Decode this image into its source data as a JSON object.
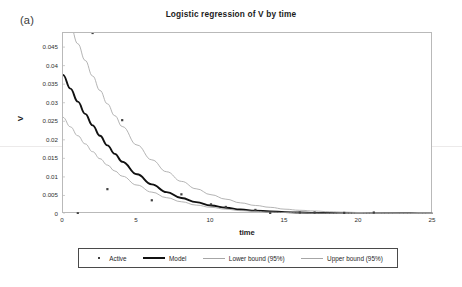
{
  "panel": {
    "label": "(a)"
  },
  "chart_data": {
    "type": "scatter",
    "title": "Logistic regression of V by time",
    "xlabel": "time",
    "ylabel": "V",
    "xlim": [
      0,
      25
    ],
    "ylim": [
      0,
      0.0488
    ],
    "grid": false,
    "legend_position": "bottom",
    "xticks": [
      "0",
      "5",
      "10",
      "15",
      "20",
      "25"
    ],
    "xtick_values": [
      0,
      5,
      10,
      15,
      20,
      25
    ],
    "yticks": [
      "0",
      "0.005",
      "0.01",
      "0.015",
      "0.02",
      "0.025",
      "0.03",
      "0.035",
      "0.04",
      "0.045"
    ],
    "ytick_values": [
      0,
      0.005,
      0.01,
      0.015,
      0.02,
      0.025,
      0.03,
      0.035,
      0.04,
      0.045
    ],
    "series": [
      {
        "name": "Active",
        "type": "scatter",
        "marker": "dot",
        "color": "#404040",
        "x": [
          1,
          2,
          3,
          4,
          6,
          8,
          10,
          11,
          13,
          14,
          16,
          17,
          19,
          21
        ],
        "y": [
          0.0002,
          0.0488,
          0.0067,
          0.0253,
          0.0037,
          0.0053,
          0.0026,
          0.0019,
          0.0011,
          0.0002,
          0.0004,
          0.0004,
          0.0003,
          0.0004
        ]
      },
      {
        "name": "Model",
        "type": "line",
        "color": "#111111",
        "x": [
          0,
          0.5,
          1,
          1.5,
          2,
          2.5,
          3,
          3.5,
          4,
          5,
          6,
          7,
          8,
          9,
          10,
          11,
          12,
          13,
          14,
          15,
          16,
          17,
          18,
          19,
          20,
          21,
          22,
          23,
          24,
          25
        ],
        "y": [
          0.0375,
          0.0338,
          0.0303,
          0.027,
          0.0239,
          0.0211,
          0.0185,
          0.0162,
          0.0141,
          0.0107,
          0.008,
          0.0059,
          0.0043,
          0.0032,
          0.0023,
          0.0017,
          0.0012,
          0.0009,
          0.0007,
          0.0005,
          0.0004,
          0.0003,
          0.00025,
          0.0002,
          0.00018,
          0.00015,
          0.00013,
          0.00012,
          0.00011,
          0.0001
        ]
      },
      {
        "name": "Lower bound (95%)",
        "type": "line",
        "color": "#a6a6a6",
        "x": [
          0,
          0.5,
          1,
          1.5,
          2,
          2.5,
          3,
          3.5,
          4,
          5,
          6,
          7,
          8,
          9,
          10,
          11,
          12,
          13,
          14,
          15,
          16,
          17,
          18,
          19,
          20,
          21,
          22,
          23,
          24,
          25
        ],
        "y": [
          0.0261,
          0.0235,
          0.0211,
          0.0189,
          0.0168,
          0.0149,
          0.0132,
          0.0116,
          0.0102,
          0.0078,
          0.0059,
          0.0044,
          0.0033,
          0.0024,
          0.0018,
          0.0013,
          0.0009,
          0.0007,
          0.0005,
          0.0004,
          0.0003,
          0.00022,
          0.00018,
          0.00015,
          0.00013,
          0.00011,
          0.0001,
          9e-05,
          8e-05,
          8e-05
        ]
      },
      {
        "name": "Upper bound (95%)",
        "type": "line",
        "color": "#a6a6a6",
        "x": [
          0,
          0.5,
          1,
          1.5,
          2,
          2.5,
          3,
          3.5,
          4,
          5,
          6,
          7,
          8,
          9,
          10,
          11,
          12,
          13,
          14,
          15,
          16,
          17,
          18,
          19,
          20,
          21,
          22,
          23,
          24,
          25
        ],
        "y": [
          0.056,
          0.0508,
          0.0459,
          0.0414,
          0.0372,
          0.0333,
          0.0297,
          0.0265,
          0.0236,
          0.0186,
          0.0146,
          0.0114,
          0.0088,
          0.0068,
          0.0052,
          0.004,
          0.003,
          0.0023,
          0.0018,
          0.0013,
          0.001,
          0.0008,
          0.0006,
          0.0005,
          0.0004,
          0.0003,
          0.00025,
          0.0002,
          0.00018,
          0.00015
        ]
      }
    ]
  },
  "legend": {
    "items": [
      {
        "label": "Active",
        "marker": "dot"
      },
      {
        "label": "Model",
        "marker": "thick-line"
      },
      {
        "label": "Lower bound (95%)",
        "marker": "thin-line"
      },
      {
        "label": "Upper bound (95%)",
        "marker": "thin-line"
      }
    ]
  }
}
